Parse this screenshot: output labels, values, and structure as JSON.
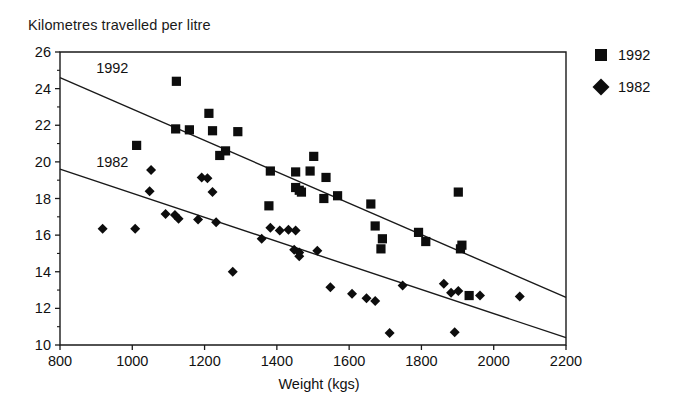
{
  "chart_data": {
    "type": "scatter",
    "title": "Kilometres travelled per litre",
    "xlabel": "Weight (kgs)",
    "ylabel": "Kilometres travelled per litre",
    "xlim": [
      800,
      2200
    ],
    "ylim": [
      10,
      26
    ],
    "xticks": [
      800,
      1000,
      1200,
      1400,
      1600,
      1800,
      2000,
      2200
    ],
    "xtick_labels": [
      "800",
      "1000",
      "1200",
      "1400",
      "1600",
      "1800",
      "2000",
      "2200"
    ],
    "yticks": [
      10,
      12,
      14,
      16,
      18,
      20,
      22,
      24,
      26
    ],
    "ytick_labels": [
      "10",
      "12",
      "14",
      "16",
      "18",
      "20",
      "22",
      "24",
      "26"
    ],
    "yminor_ticks": [
      11,
      13,
      15,
      17,
      19,
      21,
      23,
      25
    ],
    "grid": false,
    "legend_position": "right",
    "axes_style": "box",
    "annotations": [
      {
        "text": "1992",
        "x": 900,
        "y": 25.1
      },
      {
        "text": "1982",
        "x": 900,
        "y": 20.0
      }
    ],
    "series": [
      {
        "name": "1992",
        "marker": "square",
        "color": "#0d0d0d",
        "points": [
          [
            1122,
            24.4
          ],
          [
            1012,
            20.9
          ],
          [
            1212,
            22.65
          ],
          [
            1120,
            21.8
          ],
          [
            1158,
            21.75
          ],
          [
            1222,
            21.7
          ],
          [
            1292,
            21.65
          ],
          [
            1258,
            20.6
          ],
          [
            1242,
            20.35
          ],
          [
            1382,
            19.5
          ],
          [
            1452,
            19.45
          ],
          [
            1378,
            17.6
          ],
          [
            1452,
            18.6
          ],
          [
            1462,
            18.45
          ],
          [
            1468,
            18.35
          ],
          [
            1502,
            20.3
          ],
          [
            1492,
            19.5
          ],
          [
            1536,
            19.15
          ],
          [
            1530,
            18.0
          ],
          [
            1568,
            18.15
          ],
          [
            1660,
            17.7
          ],
          [
            1672,
            16.5
          ],
          [
            1692,
            15.8
          ],
          [
            1688,
            15.25
          ],
          [
            1792,
            16.15
          ],
          [
            1812,
            15.65
          ],
          [
            1902,
            18.35
          ],
          [
            1912,
            15.45
          ],
          [
            1908,
            15.25
          ],
          [
            1932,
            12.7
          ]
        ]
      },
      {
        "name": "1982",
        "marker": "diamond",
        "color": "#0d0d0d",
        "points": [
          [
            918,
            16.35
          ],
          [
            1008,
            16.35
          ],
          [
            1052,
            19.55
          ],
          [
            1048,
            18.4
          ],
          [
            1092,
            17.15
          ],
          [
            1118,
            17.1
          ],
          [
            1128,
            16.9
          ],
          [
            1192,
            19.15
          ],
          [
            1208,
            19.1
          ],
          [
            1182,
            16.85
          ],
          [
            1222,
            18.35
          ],
          [
            1278,
            14.0
          ],
          [
            1232,
            16.7
          ],
          [
            1358,
            15.8
          ],
          [
            1382,
            16.4
          ],
          [
            1408,
            16.25
          ],
          [
            1432,
            16.3
          ],
          [
            1452,
            16.25
          ],
          [
            1448,
            15.2
          ],
          [
            1462,
            15.05
          ],
          [
            1462,
            14.85
          ],
          [
            1512,
            15.15
          ],
          [
            1548,
            13.15
          ],
          [
            1608,
            12.8
          ],
          [
            1648,
            12.55
          ],
          [
            1672,
            12.4
          ],
          [
            1712,
            10.65
          ],
          [
            1748,
            13.25
          ],
          [
            1862,
            13.35
          ],
          [
            1882,
            12.85
          ],
          [
            1902,
            12.95
          ],
          [
            1892,
            10.7
          ],
          [
            1962,
            12.7
          ],
          [
            2072,
            12.65
          ]
        ]
      }
    ],
    "trend_lines": [
      {
        "name": "1992",
        "x0": 800,
        "y0": 24.6,
        "x1": 2200,
        "y1": 12.6
      },
      {
        "name": "1982",
        "x0": 800,
        "y0": 19.6,
        "x1": 2200,
        "y1": 10.4
      }
    ]
  },
  "legend": {
    "items": [
      {
        "label": "1992",
        "marker": "square"
      },
      {
        "label": "1982",
        "marker": "diamond"
      }
    ]
  }
}
